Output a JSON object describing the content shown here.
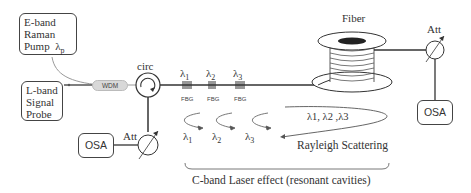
{
  "diagram": {
    "components": {
      "pump": {
        "lines": [
          "E-band",
          "Raman",
          "Pump"
        ],
        "symbol": "λ",
        "symbol_sub": "p"
      },
      "probe": {
        "lines": [
          "L-band",
          "Signal",
          "Probe"
        ]
      },
      "wdm": {
        "label": "WDM"
      },
      "circulator": {
        "label": "circ"
      },
      "fiber": {
        "label": "Fiber"
      },
      "att_left": {
        "label": "Att"
      },
      "att_right": {
        "label": "Att"
      },
      "osa_left": {
        "label": "OSA"
      },
      "osa_right": {
        "label": "OSA"
      }
    },
    "fbgs": [
      {
        "lambda": "λ",
        "sub": "1",
        "label": "FBG"
      },
      {
        "lambda": "λ",
        "sub": "2",
        "label": "FBG"
      },
      {
        "lambda": "λ",
        "sub": "3",
        "label": "FBG"
      }
    ],
    "reflections": [
      {
        "lambda": "λ",
        "sub": "1"
      },
      {
        "lambda": "λ",
        "sub": "2"
      },
      {
        "lambda": "λ",
        "sub": "3"
      }
    ],
    "rayleigh": {
      "wavelengths": "λ1, λ2 ,λ3",
      "label": "Rayleigh Scattering"
    },
    "caption": "C-band Laser effect (resonant cavities)",
    "colors": {
      "line": "#333333",
      "wdm_fill": "#d8d8d8",
      "pump_line": "#999999"
    }
  }
}
